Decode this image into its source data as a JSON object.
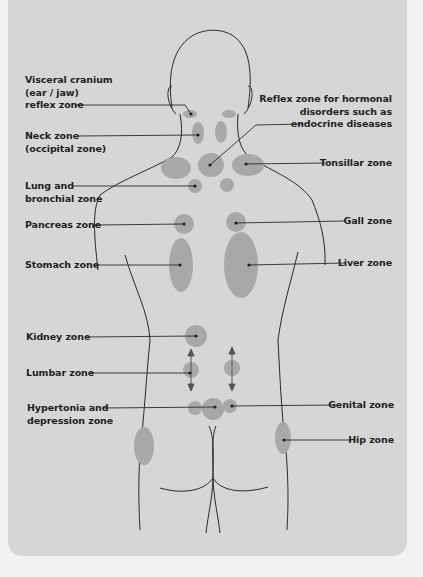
{
  "diagram": {
    "colors": {
      "background": "#f2f2f2",
      "panel": "#d6d6d6",
      "zone_fill": "#a8a8a8",
      "outline": "#2a2a2a"
    },
    "left_labels": [
      {
        "id": "visceral-cranium",
        "text": "Visceral cranium\n(ear / jaw)\nreflex zone"
      },
      {
        "id": "neck",
        "text": "Neck zone\n(occipital zone)"
      },
      {
        "id": "lung-bronchial",
        "text": "Lung and\nbronchial zone"
      },
      {
        "id": "pancreas",
        "text": "Pancreas zone"
      },
      {
        "id": "stomach",
        "text": "Stomach zone"
      },
      {
        "id": "kidney",
        "text": "Kidney zone"
      },
      {
        "id": "lumbar",
        "text": "Lumbar zone"
      },
      {
        "id": "hypertonia-depression",
        "text": "Hypertonia and\ndepression zone"
      }
    ],
    "right_labels": [
      {
        "id": "hormonal",
        "text": "Reflex zone for hormonal\ndisorders such as\nendocrine diseases"
      },
      {
        "id": "tonsillar",
        "text": "Tonsillar zone"
      },
      {
        "id": "gall",
        "text": "Gall zone"
      },
      {
        "id": "liver",
        "text": "Liver zone"
      },
      {
        "id": "genital",
        "text": "Genital zone"
      },
      {
        "id": "hip",
        "text": "Hip zone"
      }
    ]
  }
}
